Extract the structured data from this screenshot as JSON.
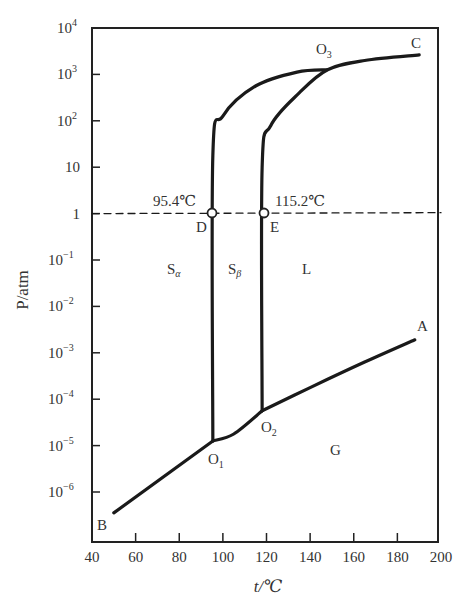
{
  "chart_data": {
    "type": "line",
    "title": "",
    "xlabel": "t/℃",
    "ylabel": "P/atm",
    "xlim": [
      40,
      200
    ],
    "ylim_log10": [
      -6.5,
      4
    ],
    "yscale": "log",
    "grid": false,
    "x_ticks": [
      40,
      60,
      80,
      100,
      120,
      140,
      160,
      180,
      200
    ],
    "y_ticks": [
      {
        "exp": 4,
        "label": "10",
        "sup": "4"
      },
      {
        "exp": 3,
        "label": "10",
        "sup": "3"
      },
      {
        "exp": 2,
        "label": "10",
        "sup": "2"
      },
      {
        "exp": 1,
        "label": "10",
        "sup": ""
      },
      {
        "exp": 0,
        "label": "1",
        "sup": ""
      },
      {
        "exp": -1,
        "label": "10",
        "sup": "−1"
      },
      {
        "exp": -2,
        "label": "10",
        "sup": "−2"
      },
      {
        "exp": -3,
        "label": "10",
        "sup": "−3"
      },
      {
        "exp": -4,
        "label": "10",
        "sup": "−4"
      },
      {
        "exp": -5,
        "label": "10",
        "sup": "−5"
      },
      {
        "exp": -6,
        "label": "10",
        "sup": "−6"
      }
    ],
    "series": [
      {
        "name": "B-O1 (Sα/G sublimation)",
        "points": [
          [
            50,
            -6.45
          ],
          [
            95.4,
            -4.9
          ]
        ]
      },
      {
        "name": "O1-O2 (Sβ/G sublimation)",
        "points": [
          [
            95.4,
            -4.9
          ],
          [
            105,
            -4.75
          ],
          [
            118,
            -4.25
          ]
        ]
      },
      {
        "name": "O2-A (L/G vaporization)",
        "points": [
          [
            118,
            -4.25
          ],
          [
            140,
            -3.75
          ],
          [
            165,
            -3.2
          ],
          [
            188,
            -2.72
          ]
        ]
      },
      {
        "name": "O1-O3 (Sα/Sβ transition)",
        "points": [
          [
            95.4,
            -4.9
          ],
          [
            95.4,
            1.25
          ],
          [
            100,
            2.1
          ],
          [
            115,
            2.75
          ],
          [
            134,
            3.05
          ],
          [
            148,
            3.1
          ]
        ]
      },
      {
        "name": "O2-C (Sβ-L melting / S-L)",
        "points": [
          [
            118,
            -4.25
          ],
          [
            118,
            1.0
          ],
          [
            122,
            1.9
          ],
          [
            135,
            2.6
          ],
          [
            148,
            3.1
          ],
          [
            165,
            3.3
          ],
          [
            190,
            3.42
          ]
        ]
      },
      {
        "name": "1 atm isobar",
        "style": "dashed",
        "points": [
          [
            40,
            0
          ],
          [
            200,
            0.02
          ]
        ]
      }
    ],
    "special_points": [
      {
        "label": "D",
        "t": 95.4,
        "P": 1,
        "annotation": "95.4℃"
      },
      {
        "label": "E",
        "t": 115.2,
        "P": 1,
        "annotation": "115.2℃"
      },
      {
        "label": "O1",
        "t": 95.4,
        "log10P": -4.9
      },
      {
        "label": "O2",
        "t": 118,
        "log10P": -4.25
      },
      {
        "label": "O3",
        "t": 148,
        "log10P": 3.1
      }
    ],
    "annotations": [
      {
        "text": "A",
        "t": 190,
        "log10P": -2.55
      },
      {
        "text": "B",
        "t": 45,
        "log10P": -6.5
      },
      {
        "text": "C",
        "t": 191,
        "log10P": 3.6
      },
      {
        "text": "G",
        "t": 155,
        "log10P": -5.1
      },
      {
        "text": "L",
        "t": 140,
        "log10P": -1.1
      },
      {
        "text": "Sα",
        "t": 80,
        "log10P": -1.1
      },
      {
        "text": "Sβ",
        "t": 105,
        "log10P": -1.1
      }
    ]
  },
  "labels": {
    "xlabel": "t/℃",
    "ylabel": "P/atm",
    "D": "D",
    "E": "E",
    "D_temp": "95.4℃",
    "E_temp": "115.2℃",
    "O1": "O",
    "O1_sub": "1",
    "O2": "O",
    "O2_sub": "2",
    "O3": "O",
    "O3_sub": "3",
    "A": "A",
    "B": "B",
    "C": "C",
    "G": "G",
    "L": "L",
    "S_alpha": "S",
    "S_alpha_sub": "α",
    "S_beta": "S",
    "S_beta_sub": "β"
  }
}
